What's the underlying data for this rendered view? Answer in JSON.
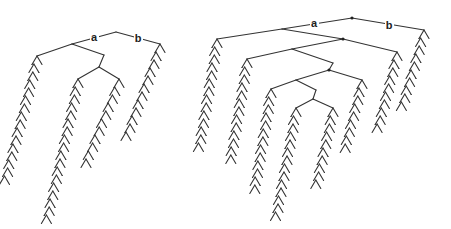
{
  "figure": {
    "stroke_color": "#333333",
    "trees": [
      {
        "id": "left-tree",
        "labels": [
          {
            "text": "a",
            "x": 94,
            "y": 41
          },
          {
            "text": "b",
            "x": 138,
            "y": 42
          }
        ],
        "dots": [],
        "edges": [
          [
            116,
            32,
            72,
            44
          ],
          [
            116,
            32,
            160,
            44
          ],
          [
            72,
            44,
            37,
            56
          ],
          [
            72,
            44,
            104,
            55
          ],
          [
            104,
            55,
            99,
            67
          ],
          [
            99,
            67,
            78,
            79
          ],
          [
            99,
            67,
            119,
            79
          ]
        ],
        "chains": [
          {
            "x": 37,
            "y": 56,
            "steps": 16,
            "dx": -0.7,
            "flip": false
          },
          {
            "x": 78,
            "y": 79,
            "steps": 18,
            "dx": -0.6,
            "flip": false
          },
          {
            "x": 119,
            "y": 79,
            "steps": 11,
            "dx": -1.1,
            "flip": false
          },
          {
            "x": 160,
            "y": 44,
            "steps": 12,
            "dx": -1.0,
            "flip": false
          }
        ]
      },
      {
        "id": "right-tree",
        "labels": [
          {
            "text": "a",
            "x": 314,
            "y": 27
          },
          {
            "text": "b",
            "x": 389,
            "y": 29
          }
        ],
        "dots": [
          [
            352,
            18
          ],
          [
            343,
            39
          ],
          [
            329,
            70
          ]
        ],
        "edges": [
          [
            352,
            18,
            282,
            29
          ],
          [
            352,
            18,
            424,
            30
          ],
          [
            282,
            29,
            217,
            39
          ],
          [
            282,
            29,
            343,
            39
          ],
          [
            343,
            39,
            292,
            49
          ],
          [
            343,
            39,
            397,
            52
          ],
          [
            292,
            49,
            247,
            59
          ],
          [
            292,
            49,
            333,
            63
          ],
          [
            333,
            63,
            329,
            70
          ],
          [
            329,
            70,
            296,
            80
          ],
          [
            329,
            70,
            362,
            80
          ],
          [
            296,
            80,
            271,
            89
          ],
          [
            296,
            80,
            316,
            90
          ],
          [
            316,
            90,
            313,
            99
          ],
          [
            313,
            99,
            296,
            108
          ],
          [
            313,
            99,
            333,
            108
          ]
        ],
        "chains": [
          {
            "x": 217,
            "y": 39,
            "steps": 14,
            "dx": -0.45,
            "flip": false
          },
          {
            "x": 247,
            "y": 59,
            "steps": 13,
            "dx": -0.45,
            "flip": false
          },
          {
            "x": 271,
            "y": 89,
            "steps": 13,
            "dx": -0.45,
            "flip": false
          },
          {
            "x": 296,
            "y": 108,
            "steps": 14,
            "dx": -0.5,
            "flip": false
          },
          {
            "x": 333,
            "y": 108,
            "steps": 10,
            "dx": -0.6,
            "flip": false
          },
          {
            "x": 362,
            "y": 80,
            "steps": 9,
            "dx": -0.7,
            "flip": false
          },
          {
            "x": 397,
            "y": 52,
            "steps": 10,
            "dx": -0.7,
            "flip": false
          },
          {
            "x": 424,
            "y": 30,
            "steps": 10,
            "dx": -0.8,
            "flip": false
          }
        ]
      }
    ]
  }
}
